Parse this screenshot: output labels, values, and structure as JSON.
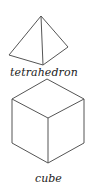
{
  "figure": {
    "shapes": [
      {
        "name": "tetrahedron",
        "label": "tetrahedron",
        "stroke": "#555555"
      },
      {
        "name": "cube",
        "label": "cube",
        "stroke": "#555555"
      }
    ],
    "background": "#ffffff"
  }
}
